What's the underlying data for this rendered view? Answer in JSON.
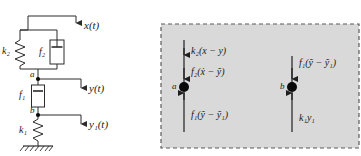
{
  "figure": {
    "colors": {
      "line": "#2b2b2b",
      "panel_fill": "#d9d9d9",
      "panel_border": "#5a5a5a",
      "node": "#0a0a0a",
      "text": "#1a1a1a"
    }
  },
  "schematic": {
    "name": "mechanical-schematic",
    "displacements": [
      {
        "id": "x",
        "label": "x(t)"
      },
      {
        "id": "y",
        "label": "y(t)"
      },
      {
        "id": "y1",
        "label": "y₁(t)"
      }
    ],
    "elements": [
      {
        "id": "k2",
        "type": "spring",
        "label": "k₂"
      },
      {
        "id": "f2",
        "type": "damper",
        "label": "f₂"
      },
      {
        "id": "f1",
        "type": "damper",
        "label": "f₁"
      },
      {
        "id": "k1",
        "type": "spring",
        "label": "k₁"
      }
    ],
    "nodes": [
      {
        "id": "a",
        "label": "a"
      },
      {
        "id": "b",
        "label": "b"
      }
    ],
    "ground": {
      "label": "ground-hatching"
    }
  },
  "fbd": {
    "name": "free-body-diagram-panel",
    "node_a": {
      "label": "a",
      "forces": [
        {
          "id": "k2-force",
          "label": "k₂(x − y)",
          "direction": "down-into-node"
        },
        {
          "id": "f2-force",
          "label": "f₂(ẋ − ỹ)",
          "direction": "down-into-node"
        },
        {
          "id": "f1-force",
          "label": "f₁(ỹ − ỹ₁)",
          "direction": "up-into-node"
        }
      ]
    },
    "node_b": {
      "label": "b",
      "forces": [
        {
          "id": "f1-force-b",
          "label": "f₁(ỹ − ỹ₁)",
          "direction": "down-into-node"
        },
        {
          "id": "k1-force-b",
          "label": "k₁y₁",
          "direction": "up-into-node"
        }
      ]
    }
  }
}
